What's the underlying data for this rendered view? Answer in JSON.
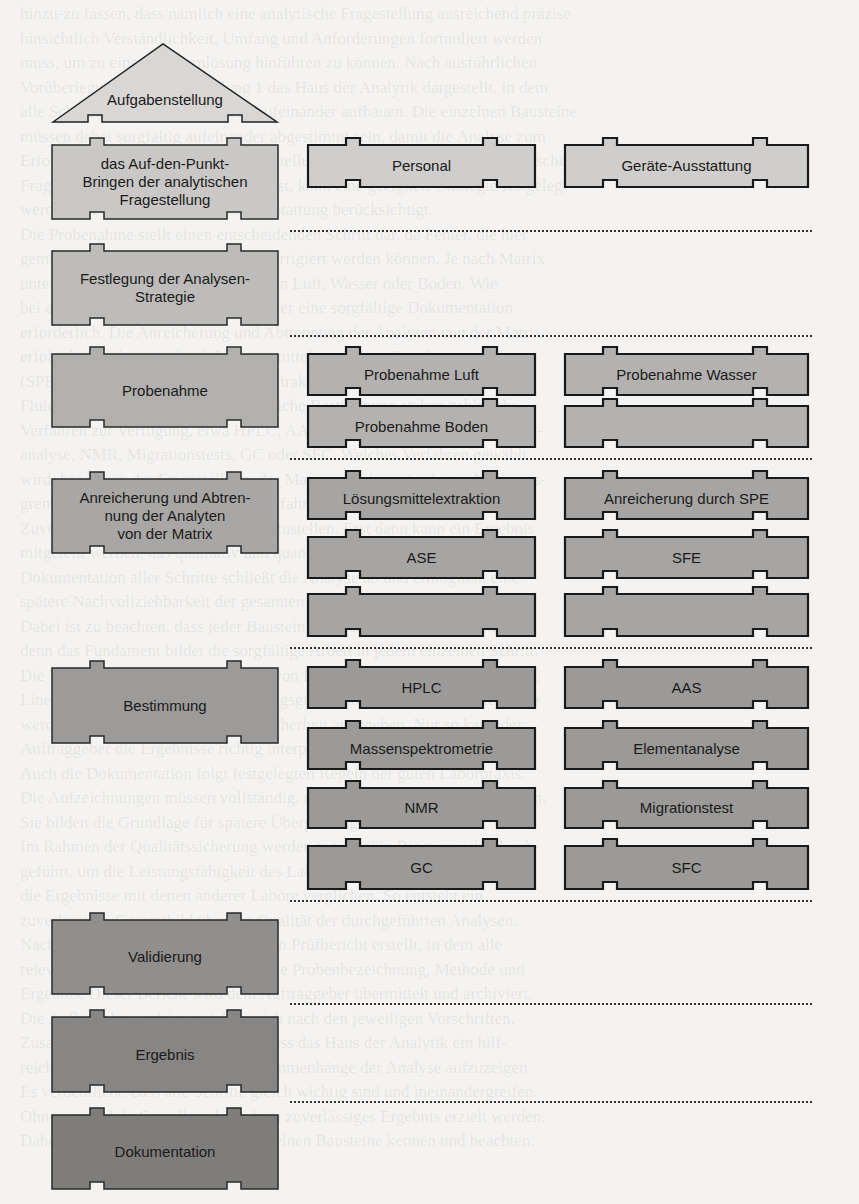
{
  "diagram": {
    "title_block": {
      "label": "Aufgabenstellung"
    },
    "left_column": [
      {
        "label": "das Auf-den-Punkt-\nBringen der analytischen\nFragestellung",
        "fill": "#c9c8c6"
      },
      {
        "label": "Festlegung der Analysen-\nStrategie",
        "fill": "#bdbcba"
      },
      {
        "label": "Probenahme",
        "fill": "#b1b0ae"
      },
      {
        "label": "Anreicherung und Abtren-\nnung der Analyten\nvon der Matrix",
        "fill": "#a8a7a5"
      },
      {
        "label": "Bestimmung",
        "fill": "#9c9b99"
      },
      {
        "label": "Validierung",
        "fill": "#918f8d"
      },
      {
        "label": "Ergebnis",
        "fill": "#888684"
      },
      {
        "label": "Dokumentation",
        "fill": "#7f7d7b"
      }
    ],
    "resources": [
      {
        "label": "Personal"
      },
      {
        "label": "Geräte-Ausstattung"
      }
    ],
    "sampling": [
      {
        "label": "Probenahme Luft"
      },
      {
        "label": "Probenahme Wasser"
      },
      {
        "label": "Probenahme Boden"
      },
      {
        "label": ""
      }
    ],
    "enrichment": [
      {
        "label": "Lösungsmittelextraktion"
      },
      {
        "label": "Anreicherung durch SPE"
      },
      {
        "label": "ASE"
      },
      {
        "label": "SFE"
      },
      {
        "label": ""
      },
      {
        "label": ""
      }
    ],
    "determination": [
      {
        "label": "HPLC"
      },
      {
        "label": "AAS"
      },
      {
        "label": "Massenspektrometrie"
      },
      {
        "label": "Elementanalyse"
      },
      {
        "label": "NMR"
      },
      {
        "label": "Migrationstest"
      },
      {
        "label": "GC"
      },
      {
        "label": "SFC"
      }
    ]
  },
  "background_text": "hinzu-zu fassen, dass nämlich eine analytische Fragestellung ausreichend präzise\nhinsichtlich Verständlichkeit, Umfang und Anforderungen formuliert werden\nmuss, um zu einer Problemlösung hinführen zu können. Nach ausführlichen\nVorüberlegungen ist in Abbildung 1 das Haus der Analytik dargestellt, in dem\nalle Schritte einer Analyse logisch aufeinander aufbauen. Die einzelnen Bausteine\nmüssen dabei sorgfältig aufeinander abgestimmt sein, damit die Analyse zum\nErfolg führt. Erst wenn die Aufgabenstellung klar formuliert und die analytische\nFragestellung präzise erfasst worden ist, kann eine geeignete Strategie festgelegt\nwerden, die Personal und Geräte-Ausstattung berücksichtigt.\nDie Probenahme stellt einen entscheidenden Schritt dar, da Fehler, die hier\ngemacht werden, später nicht mehr korrigiert werden können. Je nach Matrix\nunterscheidet man die Probenahme von Luft, Wasser oder Boden. Wie\nbei allen weiteren Schritten ist auch hier eine sorgfältige Dokumentation\nerforderlich. Die Anreicherung und Abtrennung der Analyten von der Matrix\nerfolgt beispielsweise durch Lösungsmittelextraktion, Festphasenextraktion\n(SPE), beschleunigte Lösungsmittelextraktion (ASE) oder überkritische\nFluidextraktion (SFE). Für die eigentliche Bestimmung stehen zahlreiche\nVerfahren zur Verfügung, etwa HPLC, AAS, Massenspektrometrie, Element-\nanalyse, NMR, Migrationstests, GC oder SFC. Welches Verfahren gewählt\nwird, hängt von der Fragestellung, der Matrix und der geforderten Nachweis-\ngrenze ab. Anschließend muss das Verfahren validiert werden, um die\nZuverlässigkeit der Ergebnisse sicherzustellen. Erst dann kann ein Ergebnis\nmitgeteilt werden, das qualitativ und quantitativ belastbar ist. Die\nDokumentation aller Schritte schließt die Analyse ab und ermöglicht eine\nspätere Nachvollziehbarkeit der gesamten Vorgehensweise im Labor.\nDabei ist zu beachten, dass jeder Baustein des Hauses tragfähig sein muss,\ndenn das Fundament bildet die sorgfältige Arbeit in jedem einzelnen Schritt.\nDie Validierung umfasst die Prüfung von Richtigkeit, Präzision, Selektivität,\nLinearität, Nachweis- und Bestimmungsgrenze sowie Robustheit. Die Werte\nwerden gemeinsam mit der Messunsicherheit angegeben. Nur so kann der\nAuftraggeber die Ergebnisse richtig interpretieren und weiterverwenden.\nAuch die Dokumentation folgt festgelegten Regeln der guten Laborpraxis.\nDie Aufzeichnungen müssen vollständig, nachvollziehbar und dauerhaft sein.\nSie bilden die Grundlage für spätere Überprüfungen durch Dritte.\nIm Rahmen der Qualitätssicherung werden regelmäßig Ringversuche durch-\ngeführt, um die Leistungsfähigkeit des Labors zu belegen. Dabei werden\ndie Ergebnisse mit denen anderer Labore verglichen. So entsteht ein\nzuverlässiges Gesamtbild über die Qualität der durchgeführten Analysen.\nNach Abschluss aller Arbeiten wird ein Prüfbericht erstellt, in dem alle\nrelevanten Angaben enthalten sind, wie Probenbezeichnung, Methode und\nErgebnis. Dieser Bericht wird dem Auftraggeber übermittelt und archiviert.\nDie Aufbewahrungsfristen richten sich nach den jeweiligen Vorschriften.\nZusammenfassend lässt sich sagen, dass das Haus der Analytik ein hilf-\nreiches Modell darstellt, um die Zusammenhänge der Analyse aufzuzeigen.\nEs verdeutlicht, dass alle Schritte gleich wichtig sind und ineinandergreifen.\nOhne eine solide Grundlage kann kein zuverlässiges Ergebnis erzielt werden.\nDaher sollte jeder Analytiker die einzelnen Bausteine kennen und beachten."
}
